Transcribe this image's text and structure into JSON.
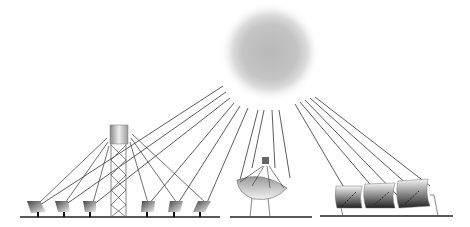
{
  "diagram": {
    "elements": [
      {
        "id": "sun",
        "label": "Sun"
      },
      {
        "id": "power-tower",
        "label": "Central receiver tower with heliostat field",
        "heliostats": 6
      },
      {
        "id": "dish",
        "label": "Parabolic dish with receiver"
      },
      {
        "id": "trough",
        "label": "Parabolic trough collectors",
        "collectors": 3
      }
    ],
    "colors": {
      "ray": "#333333",
      "ground": "#222222",
      "sun": "#bdbdbd"
    }
  }
}
